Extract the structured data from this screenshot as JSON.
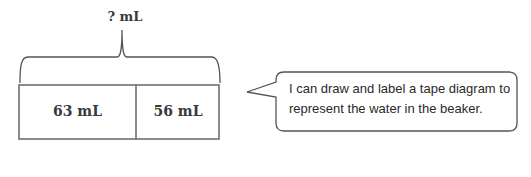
{
  "diagram": {
    "type": "tape-diagram",
    "total_label": "? mL",
    "segments": [
      {
        "label": "63 mL",
        "value": 63
      },
      {
        "label": "56 mL",
        "value": 56
      }
    ],
    "unit": "mL"
  },
  "callout": {
    "text": "I can draw and label a tape diagram to represent the water in the beaker."
  },
  "colors": {
    "stroke": "#555555",
    "text": "#3a3a3a",
    "background": "#ffffff"
  }
}
